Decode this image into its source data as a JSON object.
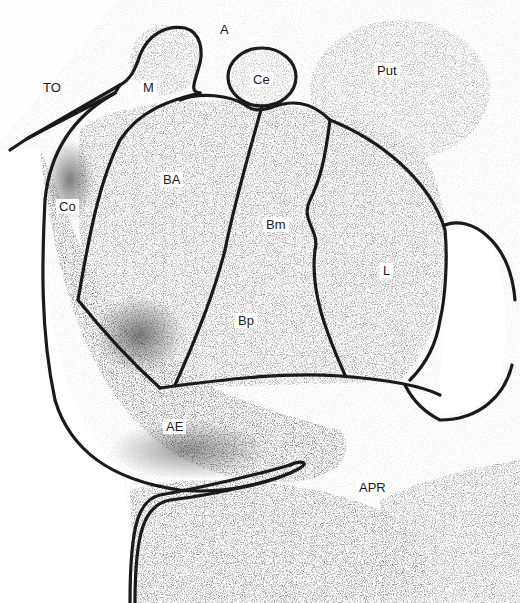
{
  "figure": {
    "labels": [
      {
        "id": "TO",
        "text": "TO",
        "x": 40,
        "y": 80
      },
      {
        "id": "M",
        "text": "M",
        "x": 140,
        "y": 80
      },
      {
        "id": "A",
        "text": "A",
        "x": 217,
        "y": 22
      },
      {
        "id": "Ce",
        "text": "Ce",
        "x": 250,
        "y": 72
      },
      {
        "id": "Put",
        "text": "Put",
        "x": 374,
        "y": 63
      },
      {
        "id": "Co",
        "text": "Co",
        "x": 56,
        "y": 199
      },
      {
        "id": "BA",
        "text": "BA",
        "x": 160,
        "y": 172
      },
      {
        "id": "Bm",
        "text": "Bm",
        "x": 263,
        "y": 217
      },
      {
        "id": "L",
        "text": "L",
        "x": 380,
        "y": 263
      },
      {
        "id": "Bp",
        "text": "Bp",
        "x": 235,
        "y": 313
      },
      {
        "id": "AE",
        "text": "AE",
        "x": 163,
        "y": 419
      },
      {
        "id": "APR",
        "text": "APR",
        "x": 356,
        "y": 480
      }
    ]
  }
}
